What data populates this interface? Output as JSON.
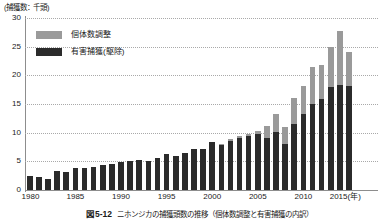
{
  "axis_title": "(捕獲数：千頭)",
  "legend": {
    "position": "top-left-inside",
    "items": [
      {
        "label": "個体数調整",
        "color": "#9a9a9a",
        "swatch": "gray-swatch"
      },
      {
        "label": "有害捕獲(駆除)",
        "color": "#2b2b2b",
        "swatch": "dark-swatch"
      }
    ]
  },
  "caption": {
    "figure_no": "図5-12",
    "text": "ニホンジカの捕獲頭数の推移（個体数調整と有害捕獲の内訳）"
  },
  "colors": {
    "series_population_adjustment": "#9a9a9a",
    "series_pest_capture": "#2b2b2b",
    "axis": "#8d8d8d",
    "gridline": "#a9a9a9",
    "background": "#ffffff"
  },
  "chart_data": {
    "type": "bar",
    "stacked": true,
    "title": "",
    "xlabel": "(年)",
    "ylabel": "(捕獲数：千頭)",
    "ylim": [
      0,
      30
    ],
    "yticks": [
      0,
      5,
      10,
      15,
      20,
      25,
      30
    ],
    "grid": true,
    "xtick_labels": [
      "1980",
      "1985",
      "1990",
      "1995",
      "2000",
      "2005",
      "2010",
      "2015(年)"
    ],
    "xtick_years": [
      1980,
      1985,
      1990,
      1995,
      2000,
      2005,
      2010,
      2015
    ],
    "categories": [
      1980,
      1981,
      1982,
      1983,
      1984,
      1985,
      1986,
      1987,
      1988,
      1989,
      1990,
      1991,
      1992,
      1993,
      1994,
      1995,
      1996,
      1997,
      1998,
      1999,
      2000,
      2001,
      2002,
      2003,
      2004,
      2005,
      2006,
      2007,
      2008,
      2009,
      2010,
      2011,
      2012,
      2013,
      2014,
      2015
    ],
    "series": [
      {
        "name": "有害捕獲(駆除)",
        "color": "#2b2b2b",
        "values": [
          2.4,
          2.2,
          2.0,
          3.3,
          3.2,
          3.9,
          3.8,
          4.0,
          4.3,
          4.6,
          4.8,
          5.1,
          5.3,
          5.1,
          5.6,
          6.3,
          5.9,
          6.5,
          7.1,
          7.2,
          8.4,
          7.9,
          8.6,
          9.0,
          9.4,
          9.8,
          9.1,
          10.2,
          8.0,
          11.5,
          13.3,
          15.0,
          15.8,
          18.0,
          18.3,
          18.2
        ]
      },
      {
        "name": "個体数調整",
        "color": "#9a9a9a",
        "values": [
          0.0,
          0.0,
          0.0,
          0.0,
          0.0,
          0.0,
          0.0,
          0.0,
          0.0,
          0.0,
          0.0,
          0.0,
          0.0,
          0.0,
          0.0,
          0.0,
          0.0,
          0.0,
          0.0,
          0.0,
          0.0,
          0.2,
          0.3,
          0.5,
          0.4,
          0.5,
          2.0,
          3.0,
          3.0,
          4.5,
          4.8,
          6.5,
          6.0,
          6.9,
          9.4,
          5.8
        ]
      }
    ],
    "totals": [
      2.4,
      2.2,
      2.0,
      3.3,
      3.2,
      3.9,
      3.8,
      4.0,
      4.3,
      4.6,
      4.8,
      5.1,
      5.3,
      5.1,
      5.6,
      6.3,
      5.9,
      6.5,
      7.1,
      7.2,
      8.4,
      8.1,
      8.9,
      9.5,
      9.8,
      10.3,
      11.1,
      13.2,
      11.0,
      16.0,
      18.1,
      21.5,
      21.8,
      24.9,
      27.7,
      24.0
    ]
  }
}
